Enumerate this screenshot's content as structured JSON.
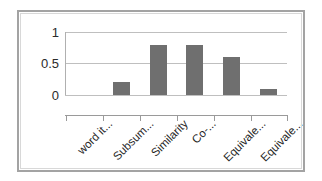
{
  "chart_data": {
    "type": "bar",
    "title": "",
    "subtitle": "",
    "xlabel": "",
    "ylabel": "",
    "categories": [
      "word it...",
      "Subsum...",
      "Similarity",
      "Co-...",
      "Equivale...",
      "Equivale..."
    ],
    "values": [
      0,
      0.2,
      0.8,
      0.8,
      0.6,
      0.1
    ],
    "series": [
      {
        "name": "Series 1",
        "values": [
          0,
          0.2,
          0.8,
          0.8,
          0.6,
          0.1
        ]
      }
    ],
    "ylim": [
      0,
      1
    ],
    "yticks": [
      "0",
      "0.5",
      "1"
    ],
    "ytick_values": [
      0,
      0.5,
      1
    ],
    "grid": true,
    "legend": false,
    "legend_position": "none",
    "bar_color": "#6f6f6f",
    "gridline_color": "#bfbfbf",
    "axis_color": "#9a9a9a",
    "frame_color": "#a3a3a3",
    "background_color": "#ffffff"
  }
}
